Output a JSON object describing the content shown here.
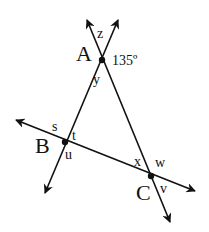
{
  "diagram": {
    "type": "geometry-triangle-transversals",
    "stroke_color": "#111111",
    "background": "#ffffff",
    "points": [
      {
        "id": "A",
        "label": "A",
        "x": 102,
        "y": 60
      },
      {
        "id": "B",
        "label": "B",
        "x": 65,
        "y": 142
      },
      {
        "id": "C",
        "label": "C",
        "x": 151,
        "y": 176
      }
    ],
    "lines": [
      {
        "id": "line-AB",
        "through": [
          "A",
          "B"
        ],
        "arrow_start": [
          118,
          20
        ],
        "arrow_end": [
          45,
          193
        ]
      },
      {
        "id": "line-AC",
        "through": [
          "A",
          "C"
        ],
        "arrow_start": [
          87,
          20
        ],
        "arrow_end": [
          170,
          222
        ]
      },
      {
        "id": "line-BC",
        "through": [
          "B",
          "C"
        ],
        "arrow_start": [
          16,
          120
        ],
        "arrow_end": [
          195,
          191
        ]
      }
    ],
    "angle_labels": {
      "z": "z",
      "given": "135º",
      "y": "y",
      "s": "s",
      "t": "t",
      "u": "u",
      "x": "x",
      "w": "w",
      "v": "v"
    },
    "vertex_labels": {
      "A": "A",
      "B": "B",
      "C": "C"
    }
  }
}
